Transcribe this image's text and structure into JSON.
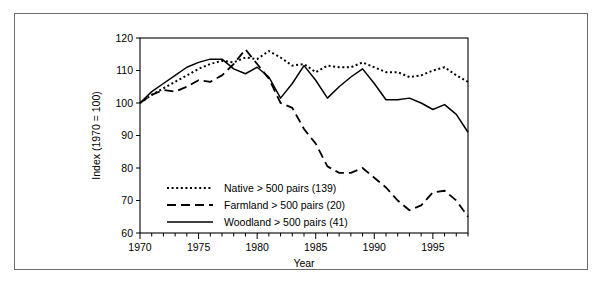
{
  "chart_data": {
    "type": "line",
    "title": "",
    "xlabel": "Year",
    "ylabel": "Index (1970 = 100)",
    "xlim": [
      1970,
      1998
    ],
    "ylim": [
      60,
      120
    ],
    "xticks": [
      1970,
      1975,
      1980,
      1985,
      1990,
      1995
    ],
    "xtick_labels": [
      "1970",
      "1975",
      "1980",
      "1985",
      "1990",
      "1995"
    ],
    "yticks": [
      60,
      70,
      80,
      90,
      100,
      110,
      120
    ],
    "ytick_labels": [
      "60",
      "70",
      "80",
      "90",
      "100",
      "110",
      "120"
    ],
    "minor_xtick_interval": 1,
    "grid": false,
    "legend_position": "lower left inside",
    "x": [
      1970,
      1971,
      1972,
      1973,
      1974,
      1975,
      1976,
      1977,
      1978,
      1979,
      1980,
      1981,
      1982,
      1983,
      1984,
      1985,
      1986,
      1987,
      1988,
      1989,
      1990,
      1991,
      1992,
      1993,
      1994,
      1995,
      1996,
      1997,
      1998
    ],
    "series": [
      {
        "name": "Native > 500 pairs (139)",
        "style": "dotted",
        "count": 139,
        "values": [
          100,
          102.5,
          104.5,
          106.5,
          108.5,
          110.5,
          112,
          113,
          112.5,
          114,
          113.5,
          116,
          114,
          111.5,
          112,
          109.5,
          111.5,
          111,
          111,
          112.5,
          111,
          109.5,
          109.5,
          108,
          108.5,
          110,
          111,
          108.5,
          106.5
        ]
      },
      {
        "name": "Farmland > 500 pairs (20)",
        "style": "dashed",
        "count": 20,
        "values": [
          100,
          102.5,
          104,
          103.5,
          105,
          107,
          106.5,
          108.5,
          112,
          116.5,
          112,
          107.5,
          100,
          98.5,
          92,
          87.5,
          80.5,
          78.5,
          78.5,
          80,
          77,
          74,
          70,
          67,
          68.5,
          72.5,
          73,
          70,
          65
        ]
      },
      {
        "name": "Woodland > 500 pairs (41)",
        "style": "solid",
        "count": 41,
        "values": [
          100,
          103.5,
          106,
          108.5,
          111,
          112.5,
          113.5,
          113.5,
          110.5,
          109,
          111,
          108,
          101.5,
          106,
          111.5,
          107,
          101.5,
          105,
          108,
          110.5,
          106,
          101,
          101,
          101.5,
          100,
          98,
          99.5,
          96.5,
          91
        ]
      }
    ]
  }
}
